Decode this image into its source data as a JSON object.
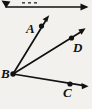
{
  "figure": {
    "kind": "geometry-diagram",
    "width": 92,
    "height": 109,
    "background_color": "#f2f1ee",
    "ink_color": "#121212"
  },
  "labels": {
    "a": "A",
    "b": "B",
    "c": "C",
    "d": "D"
  },
  "points": [
    {
      "name": "A",
      "x": 41.5,
      "y": 26.0,
      "label": "A",
      "label_x": 26,
      "label_y": 22
    },
    {
      "name": "B",
      "x": 13.0,
      "y": 74.0,
      "label": "B",
      "label_x": 1,
      "label_y": 67
    },
    {
      "name": "C",
      "x": 70.0,
      "y": 84.0,
      "label": "C",
      "label_x": 63,
      "label_y": 86
    },
    {
      "name": "D",
      "x": 71.5,
      "y": 38.0,
      "label": "D",
      "label_x": 73,
      "label_y": 41
    }
  ],
  "rays": [
    {
      "name": "ray-BA",
      "from": "B",
      "through": "A",
      "tip_x": 49,
      "tip_y": 16
    },
    {
      "name": "ray-BD",
      "from": "B",
      "through": "D",
      "tip_x": 85,
      "tip_y": 28
    },
    {
      "name": "ray-BC",
      "from": "B",
      "through": "C",
      "tip_x": 88,
      "tip_y": 86
    }
  ],
  "cropped_top_figure": {
    "name": "partial-line-above",
    "description": "Partially cropped horizontal line with arrowheads at both ends at the very top of the image",
    "left_tip_x": 2,
    "left_tip_y": 1,
    "right_tip_x": 90,
    "right_tip_y": 7,
    "baseline_y": 7
  }
}
